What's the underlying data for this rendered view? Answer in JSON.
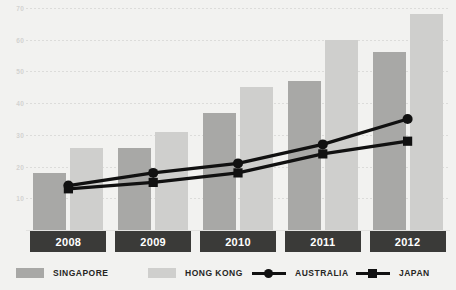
{
  "chart_data": {
    "type": "bar",
    "title": "",
    "subtitle": "",
    "xlabel": "",
    "ylabel": "",
    "categories": [
      "2008",
      "2009",
      "2010",
      "2011",
      "2012"
    ],
    "ylim": [
      0,
      70
    ],
    "yticks": [
      10,
      20,
      30,
      40,
      50,
      60,
      70
    ],
    "ytick_labels": [
      "10",
      "20",
      "30",
      "40",
      "50",
      "60",
      "70"
    ],
    "grid": true,
    "legend_position": "bottom",
    "series": [
      {
        "name": "SINGAPORE",
        "type": "bar",
        "color": "#a8a8a6",
        "values": [
          18,
          26,
          37,
          47,
          56
        ]
      },
      {
        "name": "HONG KONG",
        "type": "bar",
        "color": "#cfcfcd",
        "values": [
          26,
          31,
          45,
          60,
          68
        ]
      },
      {
        "name": "AUSTRALIA",
        "type": "line",
        "color": "#111111",
        "marker": "circle",
        "values": [
          14,
          18,
          21,
          27,
          35
        ]
      },
      {
        "name": "JAPAN",
        "type": "line",
        "color": "#111111",
        "marker": "square",
        "values": [
          13,
          15,
          18,
          24,
          28
        ]
      }
    ]
  },
  "legend": {
    "items": [
      {
        "label": "SINGAPORE",
        "icon": "square-swatch-dark"
      },
      {
        "label": "HONG KONG",
        "icon": "square-swatch-light"
      },
      {
        "label": "AUSTRALIA",
        "icon": "line-circle-marker"
      },
      {
        "label": "JAPAN",
        "icon": "line-square-marker"
      }
    ]
  },
  "colors": {
    "background": "#f2f2f0",
    "singapore": "#a8a8a6",
    "hongkong": "#cfcfcd",
    "line": "#111111",
    "year_box": "#3a3a38",
    "year_text": "#ffffff",
    "gridline": "#dcdcda",
    "ytick_text": "#d2d2d0"
  }
}
